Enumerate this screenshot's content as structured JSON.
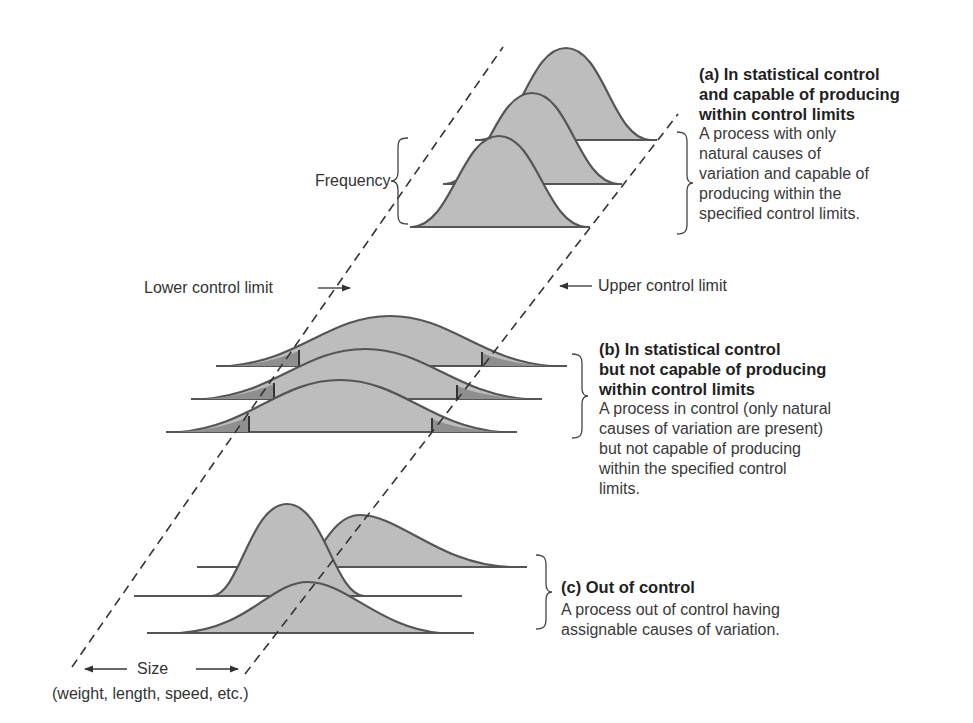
{
  "colors": {
    "fill": "#bdbdbd",
    "tail_fill": "#8f8f8f",
    "stroke": "#555555",
    "dash": "#333333",
    "text": "#333333"
  },
  "labels": {
    "frequency": "Frequency",
    "lower_control_limit": "Lower control limit",
    "upper_control_limit": "Upper control limit",
    "size": "Size",
    "size_examples": "(weight, length, speed, etc.)"
  },
  "panels": [
    {
      "id": "a",
      "heading_lines": [
        "(a)  In statistical control",
        "and capable of producing",
        "within control limits"
      ],
      "description_lines": [
        "A process with only",
        "natural causes of",
        "variation and capable of",
        "producing within the",
        "specified control limits."
      ]
    },
    {
      "id": "b",
      "heading_lines": [
        "(b)  In statistical control",
        "but not capable of producing",
        "within control limits"
      ],
      "description_lines": [
        "A process in control (only natural",
        "causes of variation are present)",
        "but not capable of producing",
        "within the specified control",
        "limits."
      ]
    },
    {
      "id": "c",
      "heading_lines": [
        "(c)  Out of control"
      ],
      "description_lines": [
        "A process out of control having",
        "assignable causes of variation."
      ]
    }
  ]
}
